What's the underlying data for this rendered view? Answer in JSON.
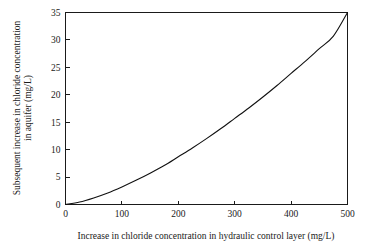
{
  "chart_data": {
    "type": "line",
    "title": "",
    "subtitle": "",
    "xlabel": "Increase in chloride concentration in hydraulic control layer (mg/L)",
    "ylabel": "Subsequent increase in chloride concentration in aquifer (mg/L)",
    "ylabel_line1": "Subsequent increase in chloride concentration",
    "ylabel_line2": "in aquifer (mg/L)",
    "xlim": [
      0,
      500
    ],
    "ylim": [
      0,
      35
    ],
    "xticks": [
      0,
      100,
      200,
      300,
      400,
      500
    ],
    "yticks": [
      0,
      5,
      10,
      15,
      20,
      25,
      30,
      35
    ],
    "xticklabels": [
      "0",
      "100",
      "200",
      "300",
      "400",
      "500"
    ],
    "yticklabels": [
      "0",
      "5",
      "10",
      "15",
      "20",
      "25",
      "30",
      "35"
    ],
    "grid": false,
    "legend": null,
    "legend_position": "none",
    "annotations": [],
    "series": [
      {
        "name": "Subsequent increase in chloride concentration in aquifer",
        "color": "#111111",
        "x": [
          0,
          25,
          50,
          75,
          100,
          125,
          150,
          175,
          200,
          225,
          250,
          275,
          300,
          325,
          350,
          375,
          400,
          425,
          450,
          475,
          500
        ],
        "values": [
          0.0,
          0.45,
          1.2,
          2.1,
          3.2,
          4.4,
          5.7,
          7.1,
          8.7,
          10.3,
          12.0,
          13.8,
          15.7,
          17.6,
          19.6,
          21.7,
          23.9,
          26.1,
          28.4,
          30.7,
          35.0
        ]
      }
    ]
  },
  "axes": {
    "x": {
      "label": "Increase in chloride concentration in hydraulic control layer (mg/L)",
      "ticks": [
        "0",
        "100",
        "200",
        "300",
        "400",
        "500"
      ]
    },
    "y": {
      "label_line1": "Subsequent increase in chloride concentration",
      "label_line2": "in aquifer (mg/L)",
      "ticks": [
        "0",
        "5",
        "10",
        "15",
        "20",
        "25",
        "30",
        "35"
      ]
    }
  },
  "style": {
    "background": "#ffffff",
    "axis_color": "#1a1a1a",
    "curve_color": "#111111"
  }
}
